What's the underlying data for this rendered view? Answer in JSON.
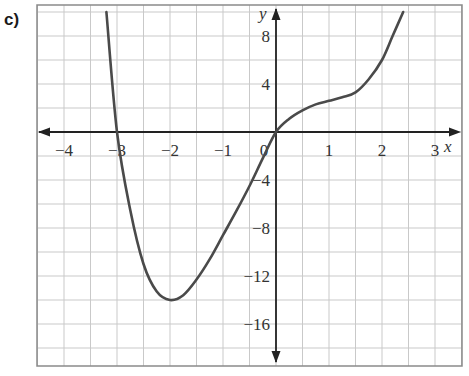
{
  "part_label": "c)",
  "chart_data": {
    "type": "line",
    "title": "",
    "xlabel": "x",
    "ylabel": "y",
    "xlim": [
      -4.5,
      3.5
    ],
    "ylim": [
      -18,
      10
    ],
    "grid": true,
    "grid_step_x": 0.5,
    "grid_step_y": 2,
    "x_ticks": [
      -4,
      -3,
      -2,
      -1,
      0,
      1,
      2,
      3
    ],
    "y_ticks": [
      8,
      4,
      -4,
      -8,
      -12,
      -16
    ],
    "x_tick_labels": [
      "−4",
      "−3",
      "−2",
      "−1",
      "0",
      "1",
      "2",
      "3"
    ],
    "y_tick_labels": [
      "8",
      "4",
      "−4",
      "−8",
      "−12",
      "−16"
    ],
    "series": [
      {
        "name": "f(x)",
        "x": [
          -3.2,
          -3.0,
          -2.75,
          -2.5,
          -2.25,
          -2.0,
          -1.75,
          -1.5,
          -1.25,
          -1.0,
          -0.75,
          -0.5,
          -0.25,
          0.0,
          0.25,
          0.5,
          0.75,
          1.0,
          1.25,
          1.5,
          1.75,
          2.0,
          2.2,
          2.4
        ],
        "y": [
          10,
          0,
          -6.5,
          -11,
          -13.3,
          -14,
          -13.6,
          -12.3,
          -10.6,
          -8.6,
          -6.6,
          -4.5,
          -2.2,
          0,
          1.1,
          1.8,
          2.3,
          2.6,
          2.9,
          3.3,
          4.4,
          6.0,
          8.0,
          10
        ]
      }
    ],
    "key_points": {
      "x_intercepts": [
        -3,
        0
      ],
      "local_minimum": [
        -2,
        -14
      ],
      "origin": [
        0,
        0
      ]
    }
  }
}
